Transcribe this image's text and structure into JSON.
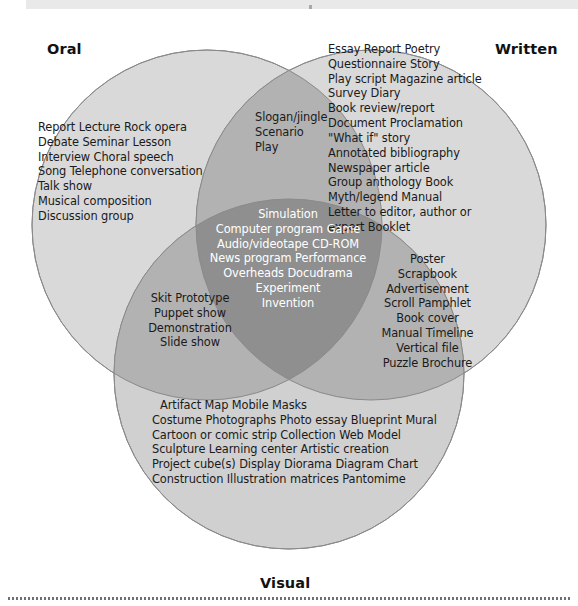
{
  "figure": {
    "type": "venn-diagram-3-set",
    "title_labels": {
      "oral": "Oral",
      "written": "Written",
      "visual": "Visual"
    },
    "colors": {
      "circle_fill": "#d9d9d9",
      "pair_overlap_fill": "#b0b0b0",
      "center_overlap_fill": "#8f8f8f",
      "stroke": "#8a8a8a",
      "text": "#1a1a1a",
      "center_text": "#ffffff",
      "top_bar": "#e9e9e9",
      "rule": "#6f6f6f"
    }
  },
  "regions": {
    "oral": {
      "name": "Oral",
      "items": [
        "Report   Lecture   Rock opera",
        "Debate   Seminar   Lesson",
        "Interview   Choral speech",
        "Song   Telephone conversation",
        "Talk show",
        "Musical composition",
        "Discussion group"
      ]
    },
    "written": {
      "name": "Written",
      "items": [
        "Essay   Report   Poetry",
        "Questionnaire   Story",
        "Play script   Magazine article",
        "Survey   Diary",
        "Book review/report",
        "Document   Proclamation",
        "\"What if\" story",
        "Annotated bibliography",
        "Newspaper article",
        "Group anthology   Book",
        "Myth/legend   Manual",
        "Letter to editor, author or",
        "expert   Booklet"
      ]
    },
    "visual": {
      "name": "Visual",
      "items": [
        "Artifact   Map   Mobile  Masks",
        "Costume   Photographs   Photo essay   Blueprint   Mural",
        "Cartoon or comic strip   Collection   Web   Model",
        "Sculpture   Learning center   Artistic creation",
        "Project cube(s)   Display   Diorama   Diagram   Chart",
        "Construction   Illustration matrices   Pantomime"
      ]
    },
    "oral_written": {
      "name": "Oral and Written",
      "items": [
        "Slogan/jingle",
        "Scenario",
        "Play"
      ]
    },
    "oral_visual": {
      "name": "Oral and Visual",
      "items": [
        "Skit   Prototype",
        "Puppet show",
        "Demonstration",
        "Slide show"
      ]
    },
    "written_visual": {
      "name": "Written and Visual",
      "items": [
        "Poster",
        "Scrapbook",
        "Advertisement",
        "Scroll   Pamphlet",
        "Book cover",
        "Manual   Timeline",
        "Vertical file",
        "Puzzle   Brochure"
      ]
    },
    "center": {
      "name": "Oral, Written and Visual",
      "items": [
        "Simulation",
        "Computer program   Game",
        "Audio/videotape   CD-ROM",
        "News program   Performance",
        "Overheads   Docudrama",
        "Experiment",
        "Invention"
      ]
    }
  }
}
